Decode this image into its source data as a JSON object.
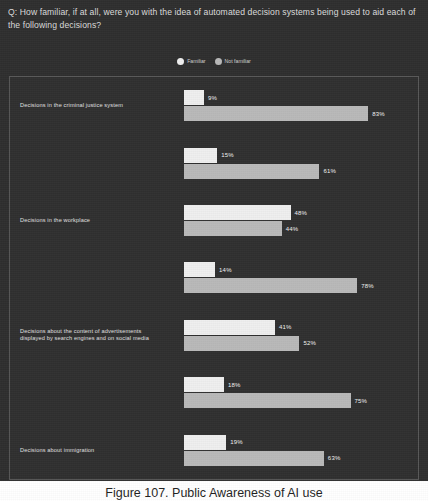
{
  "question": "Q: How familiar, if at all, were you with the idea of automated decision systems being used to aid each of the following decisions?",
  "caption": "Figure 107. Public Awareness of AI use",
  "colors": {
    "background": "#2f2f2f",
    "panel_border": "#585858",
    "familiar": "#efefef",
    "not_familiar": "#b9b9b9",
    "text": "#e0e0e0"
  },
  "legend": {
    "position": "top-center",
    "items": [
      {
        "label": "Familiar",
        "color": "#efefef",
        "icon": "circle-swatch-icon"
      },
      {
        "label": "Not familiar",
        "color": "#b9b9b9",
        "icon": "circle-swatch-icon"
      }
    ]
  },
  "chart_data": {
    "type": "bar",
    "orientation": "horizontal",
    "title": "Q: How familiar, if at all, were you with the idea of automated decision systems being used to aid each of the following decisions?",
    "xlabel": "",
    "ylabel": "",
    "xlim": [
      0,
      100
    ],
    "grid": false,
    "legend_position": "top-center",
    "value_suffix": "%",
    "categories": [
      "Decisions in the criminal justice system",
      "Decisions in the workplace",
      "Decisions about the content of advertisements displayed by search engines and on social media",
      "Decisions about immigration",
      "Decisions about access to financial services",
      "Decisions about healthcare",
      "Decisions about claims for social support"
    ],
    "series": [
      {
        "name": "Familiar",
        "color": "#efefef",
        "values": [
          9,
          15,
          48,
          14,
          41,
          18,
          19
        ],
        "labels": [
          "9%",
          "15%",
          "48%",
          "14%",
          "41%",
          "18%",
          "19%"
        ]
      },
      {
        "name": "Not familiar",
        "color": "#b9b9b9",
        "values": [
          83,
          61,
          44,
          78,
          52,
          75,
          63
        ],
        "labels": [
          "83%",
          "61%",
          "44%",
          "78%",
          "52%",
          "75%",
          "63%"
        ]
      }
    ]
  },
  "rows": [
    {
      "label_lines": [
        "Decisions in the criminal justice system"
      ],
      "familiar": 9,
      "familiar_label": "9%",
      "not_familiar": 83,
      "not_familiar_label": "83%"
    },
    {
      "label_lines": [
        "Decisions in the workplace"
      ],
      "familiar": 15,
      "familiar_label": "15%",
      "not_familiar": 61,
      "not_familiar_label": "61%"
    },
    {
      "label_lines": [
        "Decisions about the content of advertisements",
        "displayed by search engines and on social media"
      ],
      "familiar": 48,
      "familiar_label": "48%",
      "not_familiar": 44,
      "not_familiar_label": "44%"
    },
    {
      "label_lines": [
        "Decisions about immigration"
      ],
      "familiar": 14,
      "familiar_label": "14%",
      "not_familiar": 78,
      "not_familiar_label": "78%"
    },
    {
      "label_lines": [
        "Decisions about access to financial services"
      ],
      "familiar": 41,
      "familiar_label": "41%",
      "not_familiar": 52,
      "not_familiar_label": "52%"
    },
    {
      "label_lines": [
        "Decisions about healthcare"
      ],
      "familiar": 18,
      "familiar_label": "18%",
      "not_familiar": 75,
      "not_familiar_label": "75%"
    },
    {
      "label_lines": [
        "Decisions about claims for social support"
      ],
      "familiar": 19,
      "familiar_label": "19%",
      "not_familiar": 63,
      "not_familiar_label": "63%"
    }
  ]
}
